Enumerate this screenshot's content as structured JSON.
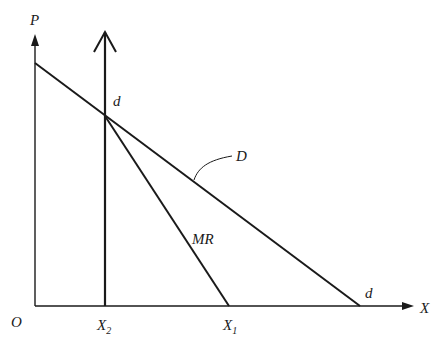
{
  "diagram": {
    "type": "economics-demand-marginal-revenue",
    "axes": {
      "y_label": "P",
      "x_label": "X",
      "origin_label": "O"
    },
    "curves": [
      {
        "id": "demand",
        "label": "D",
        "end_label": "d"
      },
      {
        "id": "marginal-revenue",
        "label": "MR"
      }
    ],
    "vertical_line": {
      "label": "X",
      "subscript": "2"
    },
    "points": {
      "intersection_label": "d"
    },
    "x_ticks": [
      {
        "label": "X",
        "subscript": "2"
      },
      {
        "label": "X",
        "subscript": "1"
      }
    ],
    "colors": {
      "line": "#1a1a1a",
      "background": "#ffffff"
    }
  }
}
